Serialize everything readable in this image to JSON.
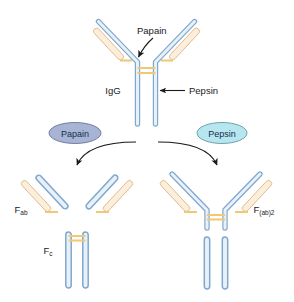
{
  "figure": {
    "background": "#ffffff",
    "width": 294,
    "height": 302
  },
  "colors": {
    "heavy_chain_fill": "#d6e4f2",
    "heavy_chain_stroke": "#7fa8cc",
    "light_chain_fill": "#fbeedd",
    "light_chain_stroke": "#e0b888",
    "disulfide": "#f0c878",
    "arrow": "#1a1a1a",
    "text": "#1a1a1a",
    "papain_badge": "#a8b4d4",
    "papain_badge_stroke": "#5a6a92",
    "pepsin_badge": "#b8e6ef",
    "pepsin_badge_stroke": "#4f8e9e"
  },
  "labels": {
    "papain_callout": "Papain",
    "pepsin_callout": "Pepsin",
    "igg": "IgG",
    "papain_badge": "Papain",
    "pepsin_badge": "Pepsin",
    "fab_base": "F",
    "fab_sub": "ab",
    "fc_base": "F",
    "fc_sub": "c",
    "fab2_base": "F",
    "fab2_sub": "(ab)2"
  },
  "diagram_parts": {
    "top_igg": "Intact IgG antibody with two heavy chains (blue) and two light chains (tan), joined at the hinge by disulfide bonds (orange)",
    "left_product": "Papain cleavage products: two separate Fab fragments and one Fc fragment",
    "right_product": "Pepsin cleavage products: one F(ab)2 fragment plus degraded Fc stub"
  }
}
